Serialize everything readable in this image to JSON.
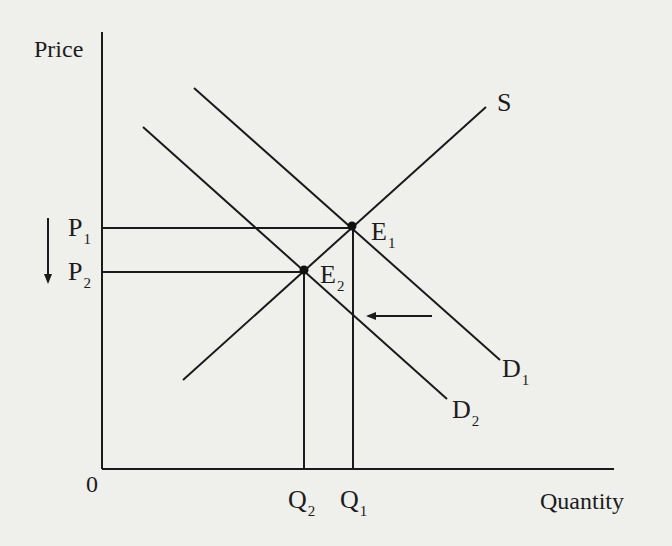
{
  "diagram": {
    "type": "supply-demand",
    "axes": {
      "y_label": "Price",
      "x_label": "Quantity",
      "origin_label": "0"
    },
    "curves": {
      "supply": {
        "label": "S"
      },
      "demand_initial": {
        "label": "D",
        "sub": "1"
      },
      "demand_new": {
        "label": "D",
        "sub": "2"
      }
    },
    "equilibria": {
      "e1": {
        "label": "E",
        "sub": "1"
      },
      "e2": {
        "label": "E",
        "sub": "2"
      }
    },
    "prices": {
      "p1": {
        "label": "P",
        "sub": "1"
      },
      "p2": {
        "label": "P",
        "sub": "2"
      }
    },
    "quantities": {
      "q1": {
        "label": "Q",
        "sub": "1"
      },
      "q2": {
        "label": "Q",
        "sub": "2"
      }
    },
    "annotations": {
      "price_arrow": "down",
      "demand_shift_arrow": "left"
    },
    "colors": {
      "background": "#efefec",
      "ink": "#1a1a1a"
    }
  }
}
